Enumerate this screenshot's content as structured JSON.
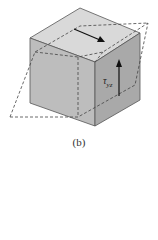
{
  "figure": {
    "caption": "(b)",
    "shear_label": {
      "symbol": "τ",
      "subscript": "yz"
    },
    "colors": {
      "top_face": "#d9d9d9",
      "left_face": "#bdbdbd",
      "right_face": "#a9a9a9",
      "edge": "#555555",
      "dashed": "#444444",
      "arrow": "#111111"
    }
  }
}
